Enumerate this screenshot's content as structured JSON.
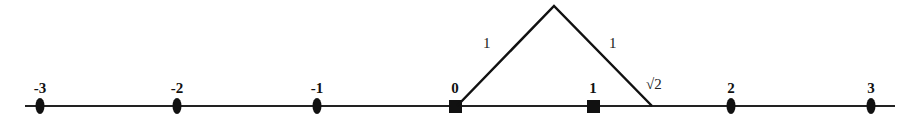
{
  "diagram": {
    "axis": {
      "y": 106,
      "x_start": 25,
      "x_end": 895,
      "color": "#222222"
    },
    "ticks": [
      {
        "label": "-3",
        "value": -3,
        "x": 40,
        "marker": "ellipse"
      },
      {
        "label": "-2",
        "value": -2,
        "x": 177,
        "marker": "ellipse"
      },
      {
        "label": "-1",
        "value": -1,
        "x": 317,
        "marker": "ellipse"
      },
      {
        "label": "0",
        "value": 0,
        "x": 455,
        "marker": "square"
      },
      {
        "label": "1",
        "value": 1,
        "x": 593,
        "marker": "square"
      },
      {
        "label": "2",
        "value": 2,
        "x": 731,
        "marker": "ellipse"
      },
      {
        "label": "3",
        "value": 3,
        "x": 871,
        "marker": "ellipse"
      }
    ],
    "triangle": {
      "origin": {
        "x": 457,
        "y": 106
      },
      "apex": {
        "x": 554,
        "y": 6
      },
      "end": {
        "x": 652,
        "y": 106
      },
      "left_side_label": "1",
      "right_side_label": "1",
      "hypotenuse_label": "√2",
      "color": "#111111"
    }
  }
}
